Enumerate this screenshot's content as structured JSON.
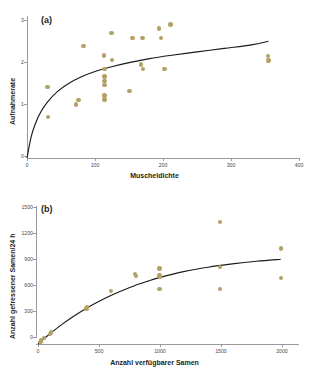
{
  "figure": {
    "background": "#ffffff",
    "marker_color": "#b3a067",
    "curve_color": "#1a1a1a",
    "axis_color": "#9a9a9a"
  },
  "chart_data": [
    {
      "type": "scatter",
      "panel_label": "(a)",
      "title": "",
      "xlabel": "Muscheldichte",
      "ylabel": "Aufnahmerate",
      "xlim": [
        0,
        400
      ],
      "ylim": [
        0,
        3.2
      ],
      "xticks": [
        0,
        100,
        200,
        300,
        400
      ],
      "xticklabels": [
        "0",
        "100",
        "200",
        "300",
        "400"
      ],
      "yticks": [
        0,
        1,
        2,
        3
      ],
      "yticklabels": [
        "0",
        "1",
        "2",
        "3"
      ],
      "grid": false,
      "legend": "none",
      "points": [
        {
          "x": 30,
          "y": 1.6
        },
        {
          "x": 31,
          "y": 0.92
        },
        {
          "x": 72,
          "y": 1.21
        },
        {
          "x": 76,
          "y": 1.31
        },
        {
          "x": 83,
          "y": 2.52
        },
        {
          "x": 113,
          "y": 2.31
        },
        {
          "x": 114,
          "y": 2.0
        },
        {
          "x": 114,
          "y": 1.84
        },
        {
          "x": 114,
          "y": 1.74
        },
        {
          "x": 114,
          "y": 1.64
        },
        {
          "x": 114,
          "y": 1.41
        },
        {
          "x": 114,
          "y": 1.32
        },
        {
          "x": 124,
          "y": 2.82
        },
        {
          "x": 125,
          "y": 2.21
        },
        {
          "x": 151,
          "y": 1.51
        },
        {
          "x": 155,
          "y": 2.71
        },
        {
          "x": 168,
          "y": 2.11
        },
        {
          "x": 170,
          "y": 2.71
        },
        {
          "x": 171,
          "y": 2.0
        },
        {
          "x": 194,
          "y": 2.92
        },
        {
          "x": 197,
          "y": 2.71
        },
        {
          "x": 202,
          "y": 2.0
        },
        {
          "x": 211,
          "y": 3.01
        },
        {
          "x": 354,
          "y": 2.3
        },
        {
          "x": 355,
          "y": 2.2
        }
      ],
      "curve": {
        "model": "Holling type II",
        "description": "saturating curve rising from origin to asymptote near 2.65",
        "points": [
          {
            "x": 0,
            "y": 0.0
          },
          {
            "x": 6,
            "y": 0.47
          },
          {
            "x": 12,
            "y": 0.76
          },
          {
            "x": 20,
            "y": 1.03
          },
          {
            "x": 30,
            "y": 1.26
          },
          {
            "x": 45,
            "y": 1.5
          },
          {
            "x": 60,
            "y": 1.67
          },
          {
            "x": 80,
            "y": 1.83
          },
          {
            "x": 100,
            "y": 1.95
          },
          {
            "x": 120,
            "y": 2.04
          },
          {
            "x": 150,
            "y": 2.15
          },
          {
            "x": 180,
            "y": 2.24
          },
          {
            "x": 210,
            "y": 2.31
          },
          {
            "x": 250,
            "y": 2.39
          },
          {
            "x": 290,
            "y": 2.47
          },
          {
            "x": 330,
            "y": 2.55
          },
          {
            "x": 355,
            "y": 2.63
          }
        ]
      }
    },
    {
      "type": "scatter",
      "panel_label": "(b)",
      "title": "",
      "xlabel": "Anzahl verfügbarer Samen",
      "ylabel": "Anzahl gefressener Samen/24 h",
      "xlim": [
        0,
        2150
      ],
      "ylim": [
        0,
        1560
      ],
      "xticks": [
        0,
        500,
        1000,
        1500,
        2000
      ],
      "xticklabels": [
        "0",
        "500",
        "1000",
        "1500",
        "2000"
      ],
      "yticks": [
        0,
        300,
        600,
        900,
        1200,
        1500
      ],
      "yticklabels": [
        "0",
        "300",
        "600",
        "900",
        "1200",
        "1500"
      ],
      "grid": false,
      "legend": "none",
      "points": [
        {
          "x": 20,
          "y": 25
        },
        {
          "x": 25,
          "y": 40
        },
        {
          "x": 50,
          "y": 70
        },
        {
          "x": 100,
          "y": 115
        },
        {
          "x": 105,
          "y": 130
        },
        {
          "x": 400,
          "y": 400
        },
        {
          "x": 405,
          "y": 415
        },
        {
          "x": 600,
          "y": 600
        },
        {
          "x": 800,
          "y": 790
        },
        {
          "x": 805,
          "y": 770
        },
        {
          "x": 1000,
          "y": 855
        },
        {
          "x": 1000,
          "y": 775
        },
        {
          "x": 1000,
          "y": 760
        },
        {
          "x": 1000,
          "y": 620
        },
        {
          "x": 1500,
          "y": 1380
        },
        {
          "x": 1500,
          "y": 870
        },
        {
          "x": 1500,
          "y": 625
        },
        {
          "x": 2000,
          "y": 1080
        },
        {
          "x": 2000,
          "y": 745
        }
      ],
      "curve": {
        "model": "Holling type II",
        "description": "saturating curve rising from origin toward asymptote near 960",
        "points": [
          {
            "x": 0,
            "y": 0
          },
          {
            "x": 50,
            "y": 60
          },
          {
            "x": 100,
            "y": 118
          },
          {
            "x": 200,
            "y": 225
          },
          {
            "x": 300,
            "y": 320
          },
          {
            "x": 400,
            "y": 405
          },
          {
            "x": 500,
            "y": 480
          },
          {
            "x": 600,
            "y": 548
          },
          {
            "x": 700,
            "y": 608
          },
          {
            "x": 800,
            "y": 662
          },
          {
            "x": 900,
            "y": 708
          },
          {
            "x": 1000,
            "y": 750
          },
          {
            "x": 1200,
            "y": 818
          },
          {
            "x": 1400,
            "y": 868
          },
          {
            "x": 1600,
            "y": 905
          },
          {
            "x": 1800,
            "y": 935
          },
          {
            "x": 2000,
            "y": 958
          }
        ]
      }
    }
  ]
}
